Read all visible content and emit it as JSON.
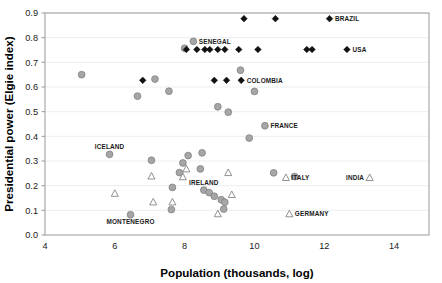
{
  "chart_data": {
    "type": "scatter",
    "title": "",
    "xlabel": "Population (thousands, log)",
    "ylabel": "Presidential power (Elgie index)",
    "xlim": [
      4,
      15
    ],
    "ylim": [
      0.0,
      0.9
    ],
    "xticks": [
      "4",
      "6",
      "8",
      "10",
      "12",
      "14"
    ],
    "xtick_values": [
      4,
      6,
      8,
      10,
      12,
      14
    ],
    "yticks": [
      "0.0",
      "0.1",
      "0.2",
      "0.3",
      "0.4",
      "0.5",
      "0.6",
      "0.7",
      "0.8",
      "0.9"
    ],
    "ytick_values": [
      0.0,
      0.1,
      0.2,
      0.3,
      0.4,
      0.5,
      0.6,
      0.7,
      0.8,
      0.9
    ],
    "grid": "horizontal",
    "legend": "none",
    "marker_colors": {
      "circle_fill": "#a6a6a6",
      "circle_stroke": "#7d7d7d",
      "diamond_fill": "#111111",
      "triangle_fill": "#ffffff",
      "triangle_stroke": "#7d7d7d",
      "gridline": "#e9ecef",
      "axis": "#9a9a9a"
    },
    "series": [
      {
        "name": "circle",
        "marker": "circle",
        "points": [
          {
            "x": 5.05,
            "y": 0.65
          },
          {
            "x": 6.65,
            "y": 0.563
          },
          {
            "x": 7.15,
            "y": 0.632
          },
          {
            "x": 7.55,
            "y": 0.583
          },
          {
            "x": 8.25,
            "y": 0.785,
            "label": "SENEGAL",
            "label_pos": "right"
          },
          {
            "x": 8.0,
            "y": 0.757
          },
          {
            "x": 9.6,
            "y": 0.668
          },
          {
            "x": 8.95,
            "y": 0.52
          },
          {
            "x": 9.25,
            "y": 0.498
          },
          {
            "x": 10.3,
            "y": 0.443,
            "label": "FRANCE",
            "label_pos": "right"
          },
          {
            "x": 10.0,
            "y": 0.582
          },
          {
            "x": 9.85,
            "y": 0.393
          },
          {
            "x": 5.85,
            "y": 0.327,
            "label": "ICELAND",
            "label_pos": "above"
          },
          {
            "x": 7.05,
            "y": 0.303
          },
          {
            "x": 7.95,
            "y": 0.292
          },
          {
            "x": 8.1,
            "y": 0.322
          },
          {
            "x": 8.5,
            "y": 0.333
          },
          {
            "x": 8.45,
            "y": 0.268
          },
          {
            "x": 7.85,
            "y": 0.253
          },
          {
            "x": 10.55,
            "y": 0.252
          },
          {
            "x": 11.15,
            "y": 0.237
          },
          {
            "x": 7.65,
            "y": 0.193
          },
          {
            "x": 8.55,
            "y": 0.182,
            "label": "IRELAND",
            "label_pos": "above"
          },
          {
            "x": 8.7,
            "y": 0.172
          },
          {
            "x": 8.85,
            "y": 0.157
          },
          {
            "x": 9.05,
            "y": 0.143
          },
          {
            "x": 9.15,
            "y": 0.133
          },
          {
            "x": 9.12,
            "y": 0.105
          },
          {
            "x": 7.62,
            "y": 0.103
          },
          {
            "x": 6.45,
            "y": 0.082,
            "label": "MONTENEGRO",
            "label_pos": "below"
          }
        ]
      },
      {
        "name": "diamond",
        "marker": "diamond",
        "points": [
          {
            "x": 9.7,
            "y": 0.877
          },
          {
            "x": 10.6,
            "y": 0.877
          },
          {
            "x": 12.15,
            "y": 0.877,
            "label": "BRAZIL",
            "label_pos": "right"
          },
          {
            "x": 8.05,
            "y": 0.752
          },
          {
            "x": 8.35,
            "y": 0.752
          },
          {
            "x": 8.58,
            "y": 0.752
          },
          {
            "x": 8.72,
            "y": 0.752
          },
          {
            "x": 8.95,
            "y": 0.752
          },
          {
            "x": 9.15,
            "y": 0.752
          },
          {
            "x": 9.55,
            "y": 0.752
          },
          {
            "x": 10.1,
            "y": 0.752
          },
          {
            "x": 11.5,
            "y": 0.752
          },
          {
            "x": 11.65,
            "y": 0.752
          },
          {
            "x": 12.65,
            "y": 0.752,
            "label": "USA",
            "label_pos": "right"
          },
          {
            "x": 6.8,
            "y": 0.627
          },
          {
            "x": 8.85,
            "y": 0.627
          },
          {
            "x": 9.2,
            "y": 0.627
          },
          {
            "x": 9.62,
            "y": 0.627,
            "label": "COLOMBIA",
            "label_pos": "right"
          }
        ]
      },
      {
        "name": "triangle",
        "marker": "triangle",
        "points": [
          {
            "x": 8.05,
            "y": 0.267
          },
          {
            "x": 9.25,
            "y": 0.252
          },
          {
            "x": 7.05,
            "y": 0.238
          },
          {
            "x": 7.95,
            "y": 0.235
          },
          {
            "x": 10.9,
            "y": 0.232,
            "label": "ITALY",
            "label_pos": "right"
          },
          {
            "x": 13.3,
            "y": 0.232,
            "label": "INDIA",
            "label_pos": "left"
          },
          {
            "x": 6.0,
            "y": 0.168
          },
          {
            "x": 9.35,
            "y": 0.163
          },
          {
            "x": 7.1,
            "y": 0.133
          },
          {
            "x": 7.65,
            "y": 0.133
          },
          {
            "x": 8.95,
            "y": 0.085
          },
          {
            "x": 11.0,
            "y": 0.085,
            "label": "GERMANY",
            "label_pos": "right"
          }
        ]
      }
    ]
  },
  "plot_geometry": {
    "left": 45,
    "top": 13,
    "right": 429,
    "bottom": 235
  }
}
